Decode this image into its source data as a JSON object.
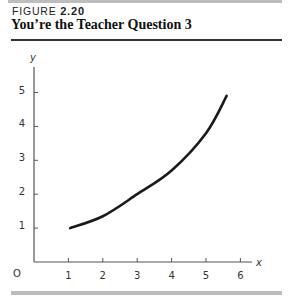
{
  "figure": {
    "label_prefix": "FIGURE",
    "label_number": "2.20",
    "title": "You’re the Teacher Question 3"
  },
  "chart_data": {
    "type": "line",
    "title": "You’re the Teacher Question 3",
    "xlabel": "x",
    "ylabel": "y",
    "origin_label": "O",
    "xlim": [
      0,
      6.3
    ],
    "ylim": [
      0,
      5.6
    ],
    "x_ticks": [
      1,
      2,
      3,
      4,
      5,
      6
    ],
    "y_ticks": [
      1,
      2,
      3,
      4,
      5
    ],
    "grid": false,
    "legend": null,
    "series": [
      {
        "name": "curve",
        "color": "#1a1a1a",
        "x": [
          1.05,
          2,
          3,
          4,
          5,
          5.6
        ],
        "y": [
          1.0,
          1.35,
          2.0,
          2.7,
          3.8,
          4.9
        ]
      }
    ]
  },
  "colors": {
    "axis": "#555555",
    "curve": "#1a1a1a",
    "rule_gray": "#bcbcbc"
  }
}
